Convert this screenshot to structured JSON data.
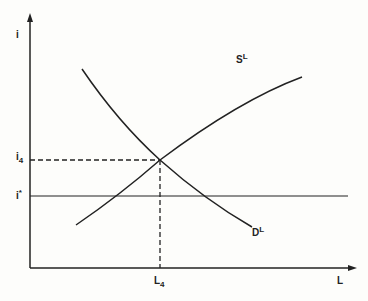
{
  "diagram": {
    "type": "supply-demand",
    "axes": {
      "y_label": "i",
      "x_label": "L"
    },
    "curves": [
      {
        "name": "supply",
        "label": "S",
        "label_sup": "L"
      },
      {
        "name": "demand",
        "label": "D",
        "label_sup": "L"
      }
    ],
    "levels": {
      "i4": {
        "label": "i",
        "sub": "4"
      },
      "istar": {
        "label": "i",
        "sup": "*"
      }
    },
    "quantity": {
      "label": "L",
      "sub": "4"
    },
    "colors": {
      "line": "#222222",
      "background": "#fdfdfb"
    }
  }
}
